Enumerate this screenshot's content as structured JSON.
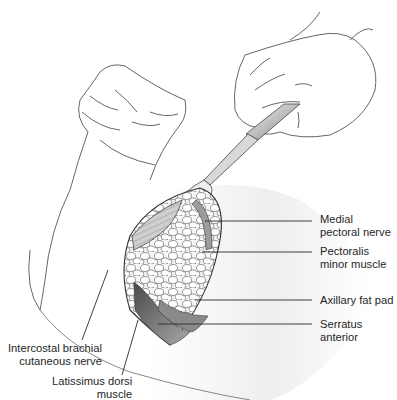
{
  "figure": {
    "type": "anatomical-illustration",
    "colors": {
      "line": "#3a3a3a",
      "skin_shadow": "#e4e4e4",
      "muscle_dark": "#5a5a5a",
      "muscle_mid": "#9a9a9a",
      "fat_fill": "#f4f4f4",
      "leader": "#2a2a2a"
    }
  },
  "labels": {
    "medial_pectoral_nerve": "Medial\npectoral nerve",
    "pectoralis_minor": "Pectoralis\nminor muscle",
    "axillary_fat_pad": "Axillary fat pad",
    "serratus_anterior": "Serratus\nanterior",
    "intercostal_brachial": "Intercostal brachial\ncutaneous nerve",
    "latissimus_dorsi": "Latissimus dorsi\nmuscle"
  }
}
